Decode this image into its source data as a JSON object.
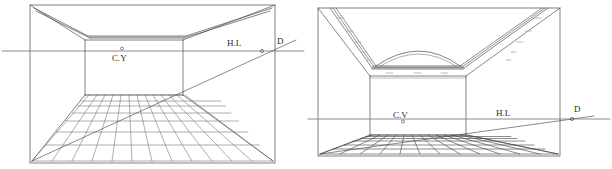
{
  "figure": {
    "background_color": "#ffffff",
    "ink_color": "#3a3a3a",
    "faint_ink_color": "#8d8d8d",
    "panel_count": 2
  },
  "panels": [
    {
      "id": "left",
      "name": "flat-ceiling-room",
      "frame": {
        "x": 30,
        "y": 5,
        "width": 245,
        "height": 158
      },
      "labels": {
        "center_of_vision": "C.Y",
        "horizon_line": "H.L",
        "diagonal_vanishing_point": "D"
      },
      "horizon": {
        "y": 51,
        "x_start": 2,
        "x_end": 304
      },
      "vanishing_point": {
        "x": 122,
        "y": 51
      },
      "diagonal_point": {
        "x": 262,
        "y": 51
      },
      "back_wall": {
        "left": 85,
        "right": 183,
        "top": 40,
        "bottom": 95
      },
      "floor_grid": {
        "columns": 12,
        "rows": 7
      },
      "ceiling": "flat coffered ceiling with double-line cornice beam"
    },
    {
      "id": "right",
      "name": "vaulted-ceiling-room",
      "frame": {
        "x": 318,
        "y": 8,
        "width": 242,
        "height": 148
      },
      "labels": {
        "center_of_vision": "C.V",
        "horizon_line": "H.L",
        "diagonal_vanishing_point": "D"
      },
      "horizon": {
        "y": 119,
        "x_start": 308,
        "x_end": 610
      },
      "vanishing_point": {
        "x": 403,
        "y": 119
      },
      "diagonal_point": {
        "x": 572,
        "y": 119
      },
      "back_wall": {
        "left": 370,
        "right": 466,
        "top": 76,
        "bottom": 135
      },
      "floor_grid": {
        "columns": 12,
        "rows": 6
      },
      "ceiling": "barrel-vaulted ceiling with arched soffit and tick-marked sloping soffits"
    }
  ],
  "label_text": {
    "cv_left": "C.Y",
    "cv_right": "C.V",
    "hl": "H.L",
    "d": "D"
  }
}
